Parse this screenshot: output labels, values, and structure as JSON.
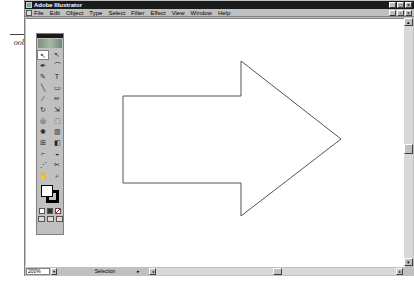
{
  "callout": {
    "text": "ool."
  },
  "window": {
    "title": "Adobe Illustrator",
    "buttons": [
      "_",
      "□",
      "×"
    ],
    "doc_buttons": [
      "_",
      "▫",
      "×"
    ]
  },
  "menu": {
    "items": [
      "File",
      "Edit",
      "Object",
      "Type",
      "Select",
      "Filter",
      "Effect",
      "View",
      "Window",
      "Help"
    ]
  },
  "toolbox": {
    "tools": [
      {
        "name": "selection-tool",
        "glyph": "↖",
        "active": true
      },
      {
        "name": "direct-selection-tool",
        "glyph": "↖"
      },
      {
        "name": "pen-tool",
        "glyph": "✒"
      },
      {
        "name": "lasso-tool",
        "glyph": "⌒"
      },
      {
        "name": "add-anchor-tool",
        "glyph": "✎"
      },
      {
        "name": "type-tool",
        "glyph": "T"
      },
      {
        "name": "line-tool",
        "glyph": "╲"
      },
      {
        "name": "rectangle-tool",
        "glyph": "▭"
      },
      {
        "name": "paintbrush-tool",
        "glyph": "∕"
      },
      {
        "name": "pencil-tool",
        "glyph": "✏"
      },
      {
        "name": "rotate-tool",
        "glyph": "↻"
      },
      {
        "name": "scale-tool",
        "glyph": "⇲"
      },
      {
        "name": "warp-tool",
        "glyph": "◎"
      },
      {
        "name": "free-transform-tool",
        "glyph": "⬚"
      },
      {
        "name": "symbol-sprayer-tool",
        "glyph": "✺"
      },
      {
        "name": "graph-tool",
        "glyph": "▥"
      },
      {
        "name": "mesh-tool",
        "glyph": "⊞"
      },
      {
        "name": "gradient-tool",
        "glyph": "◧"
      },
      {
        "name": "eyedropper-tool",
        "glyph": "⌐"
      },
      {
        "name": "paint-bucket-tool",
        "glyph": "◒"
      },
      {
        "name": "blend-tool",
        "glyph": "⋰"
      },
      {
        "name": "scissors-tool",
        "glyph": "✂"
      },
      {
        "name": "hand-tool",
        "glyph": "✋"
      },
      {
        "name": "zoom-tool",
        "glyph": "⌕"
      }
    ]
  },
  "status": {
    "zoom": "200%",
    "zoom_arrow": "▾",
    "mode": "Selection",
    "mode_arrow": "▸",
    "scroll_left": "◂",
    "scroll_right": "▸",
    "scroll_up": "▴",
    "scroll_down": "▾"
  },
  "artwork": {
    "shape": "arrow-right",
    "stroke": "#555555",
    "fill": "#ffffff",
    "points": "123,96 241,96 241,61 341,139 241,216 241,183 123,183"
  }
}
